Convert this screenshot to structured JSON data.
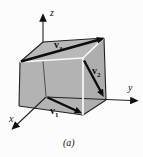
{
  "figure": {
    "caption": "(a)",
    "axis_labels": {
      "x": "x",
      "y": "y",
      "z": "z"
    },
    "vector_labels": {
      "v1": {
        "base": "v",
        "sub": "1"
      },
      "v2": {
        "base": "v",
        "sub": "2"
      },
      "v3": {
        "base": "v",
        "sub": "3"
      }
    },
    "colors": {
      "background": "#fcfcfc",
      "face_top": "#b9b9b9",
      "face_front": "#b3b3b3",
      "face_right": "#aeaeae",
      "edge": "#222222",
      "highlight": "#f8f8f8",
      "axis": "#222222",
      "vector": "#0d0d0d"
    }
  }
}
